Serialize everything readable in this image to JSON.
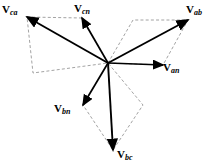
{
  "figure": {
    "type": "phasor-diagram",
    "width": 211,
    "height": 167,
    "background_color": "#ffffff",
    "stroke_color": "#000000",
    "dashed_color": "#8c8c8c"
  },
  "origin": {
    "x": 108,
    "y": 63
  },
  "labels": {
    "v_ca": {
      "symbol": "V",
      "subscript": "ca",
      "x": 2,
      "y": 4
    },
    "v_cn": {
      "symbol": "V",
      "subscript": "cn",
      "x": 74,
      "y": 3
    },
    "v_ab": {
      "symbol": "V",
      "subscript": "ab",
      "x": 186,
      "y": 4
    },
    "v_an": {
      "symbol": "V",
      "subscript": "an",
      "x": 163,
      "y": 62
    },
    "v_bn": {
      "symbol": "V",
      "subscript": "bn",
      "x": 54,
      "y": 103
    },
    "v_bc": {
      "symbol": "V",
      "subscript": "bc",
      "x": 117,
      "y": 149
    }
  },
  "chart_data": {
    "type": "scatter",
    "xlabel": "",
    "ylabel": "",
    "origin": {
      "x": 108,
      "y": 63
    },
    "note": "Solid arrows are phasors drawn from the common origin; dashed lines are parallelogram construction lines showing line voltages as differences of phase voltages.",
    "vectors": [
      {
        "name": "V_an",
        "label": "Van",
        "type": "phase",
        "tip": {
          "x": 163,
          "y": 65
        },
        "angle_deg": -2,
        "length_px": 55
      },
      {
        "name": "V_bn",
        "label": "Vbn",
        "type": "phase",
        "tip": {
          "x": 83,
          "y": 105
        },
        "angle_deg": -120,
        "length_px": 49
      },
      {
        "name": "V_cn",
        "label": "Vcn",
        "type": "phase",
        "tip": {
          "x": 82,
          "y": 18
        },
        "angle_deg": 120,
        "length_px": 52
      },
      {
        "name": "V_ab",
        "label": "Vab",
        "type": "line",
        "tip": {
          "x": 188,
          "y": 20
        },
        "angle_deg": 30,
        "length_px": 92
      },
      {
        "name": "V_bc",
        "label": "Vbc",
        "type": "line",
        "tip": {
          "x": 113,
          "y": 150
        },
        "angle_deg": -90,
        "length_px": 87
      },
      {
        "name": "V_ca",
        "label": "Vca",
        "type": "line",
        "tip": {
          "x": 27,
          "y": 17
        },
        "angle_deg": 150,
        "length_px": 92
      }
    ],
    "construction_parallelograms": [
      {
        "name": "ab-parallelogram",
        "points": [
          [
            108,
            63
          ],
          [
            133,
            20
          ],
          [
            188,
            20
          ],
          [
            163,
            65
          ]
        ]
      },
      {
        "name": "ca-parallelogram",
        "points": [
          [
            108,
            63
          ],
          [
            82,
            18
          ],
          [
            27,
            17
          ],
          [
            33,
            73
          ]
        ]
      },
      {
        "name": "bc-parallelogram",
        "points": [
          [
            108,
            63
          ],
          [
            83,
            105
          ],
          [
            113,
            150
          ],
          [
            143,
            105
          ]
        ]
      }
    ]
  }
}
